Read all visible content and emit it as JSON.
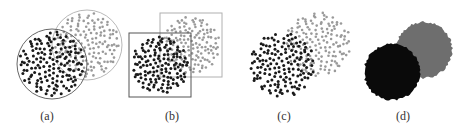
{
  "figure": {
    "background": "#ffffff",
    "dark_color": "#1a1a1a",
    "light_color": "#9a9a9a",
    "outline_dark": "#555555",
    "outline_light": "#b0b0b0",
    "panels": [
      {
        "id": "a",
        "label": "(a)",
        "label_x": 47,
        "description": "Two overlapping circular point clouds, each enclosed by a circular boundary",
        "boundary": "circle",
        "sets": [
          {
            "tone": "light",
            "cx": 87,
            "cy": 45,
            "r": 34,
            "points": 150,
            "seed": 11,
            "dot_r": 1.3,
            "outline": true
          },
          {
            "tone": "dark",
            "cx": 52,
            "cy": 64,
            "r": 34,
            "points": 150,
            "seed": 23,
            "dot_r": 1.5,
            "outline": true
          }
        ]
      },
      {
        "id": "b",
        "label": "(b)",
        "label_x": 172,
        "description": "Two overlapping circular point clouds, each enclosed by a square bounding box",
        "boundary": "square",
        "sets": [
          {
            "tone": "light",
            "cx": 191,
            "cy": 45,
            "r": 30,
            "points": 140,
            "seed": 37,
            "dot_r": 1.3,
            "outline": true
          },
          {
            "tone": "dark",
            "cx": 160,
            "cy": 65,
            "r": 30,
            "points": 140,
            "seed": 41,
            "dot_r": 1.5,
            "outline": true
          }
        ]
      },
      {
        "id": "c",
        "label": "(c)",
        "label_x": 284,
        "description": "Two overlapping circular point clouds with no boundary",
        "boundary": "none",
        "sets": [
          {
            "tone": "light",
            "cx": 318,
            "cy": 44,
            "r": 34,
            "points": 150,
            "seed": 53,
            "dot_r": 1.3,
            "outline": false
          },
          {
            "tone": "dark",
            "cx": 282,
            "cy": 65,
            "r": 34,
            "points": 150,
            "seed": 67,
            "dot_r": 1.5,
            "outline": false
          }
        ]
      },
      {
        "id": "d",
        "label": "(d)",
        "label_x": 403,
        "description": "Two overlapping filled regions (dense rendering), black in front of gray",
        "boundary": "filled",
        "sets": [
          {
            "tone": "gray",
            "cx": 424,
            "cy": 50,
            "r": 28,
            "fill": "#6e6e6e",
            "seed": 79
          },
          {
            "tone": "black",
            "cx": 392,
            "cy": 72,
            "r": 28,
            "fill": "#0a0a0a",
            "seed": 83
          }
        ]
      }
    ]
  }
}
